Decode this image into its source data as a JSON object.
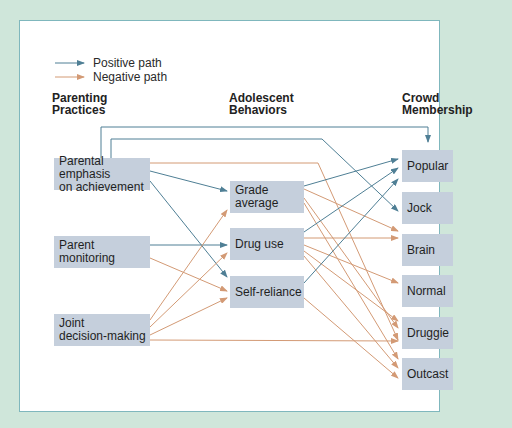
{
  "legend": {
    "positive": {
      "label": "Positive path",
      "color": "#4f7f95"
    },
    "negative": {
      "label": "Negative path",
      "color": "#d9a27c"
    }
  },
  "columns": {
    "parenting": "Parenting Practices",
    "parenting_l1": "Parenting",
    "parenting_l2": "Practices",
    "adolescent_l1": "Adolescent",
    "adolescent_l2": "Behaviors",
    "crowd_l1": "Crowd",
    "crowd_l2": "Membership"
  },
  "nodes": {
    "parental_emphasis": {
      "l1": "Parental emphasis",
      "l2": "on achievement"
    },
    "parent_monitoring": {
      "label": "Parent monitoring"
    },
    "joint_decision": {
      "l1": "Joint",
      "l2": "decision-making"
    },
    "grade_average": {
      "l1": "Grade",
      "l2": "average"
    },
    "drug_use": {
      "label": "Drug use"
    },
    "self_reliance": {
      "label": "Self-reliance"
    },
    "popular": {
      "label": "Popular"
    },
    "jock": {
      "label": "Jock"
    },
    "brain": {
      "label": "Brain"
    },
    "normal": {
      "label": "Normal"
    },
    "druggie": {
      "label": "Druggie"
    },
    "outcast": {
      "label": "Outcast"
    }
  },
  "paths": [
    {
      "from": "Parental emphasis on achievement",
      "to": "Popular",
      "type": "positive"
    },
    {
      "from": "Parental emphasis on achievement",
      "to": "Jock",
      "type": "positive"
    },
    {
      "from": "Parental emphasis on achievement",
      "to": "Grade average",
      "type": "positive"
    },
    {
      "from": "Parental emphasis on achievement",
      "to": "Self-reliance",
      "type": "positive"
    },
    {
      "from": "Parental emphasis on achievement",
      "to": "Druggie",
      "type": "negative"
    },
    {
      "from": "Parent monitoring",
      "to": "Drug use",
      "type": "positive"
    },
    {
      "from": "Parent monitoring",
      "to": "Self-reliance",
      "type": "negative"
    },
    {
      "from": "Joint decision-making",
      "to": "Grade average",
      "type": "negative"
    },
    {
      "from": "Joint decision-making",
      "to": "Drug use",
      "type": "negative"
    },
    {
      "from": "Joint decision-making",
      "to": "Self-reliance",
      "type": "negative"
    },
    {
      "from": "Joint decision-making",
      "to": "Druggie",
      "type": "negative"
    },
    {
      "from": "Grade average",
      "to": "Popular",
      "type": "positive"
    },
    {
      "from": "Grade average",
      "to": "Brain",
      "type": "negative"
    },
    {
      "from": "Grade average",
      "to": "Druggie",
      "type": "negative"
    },
    {
      "from": "Grade average",
      "to": "Outcast",
      "type": "negative"
    },
    {
      "from": "Drug use",
      "to": "Popular",
      "type": "positive"
    },
    {
      "from": "Drug use",
      "to": "Brain",
      "type": "negative"
    },
    {
      "from": "Drug use",
      "to": "Normal",
      "type": "negative"
    },
    {
      "from": "Drug use",
      "to": "Druggie",
      "type": "negative"
    },
    {
      "from": "Drug use",
      "to": "Outcast",
      "type": "negative"
    },
    {
      "from": "Self-reliance",
      "to": "Popular",
      "type": "positive"
    },
    {
      "from": "Self-reliance",
      "to": "Outcast",
      "type": "negative"
    }
  ]
}
